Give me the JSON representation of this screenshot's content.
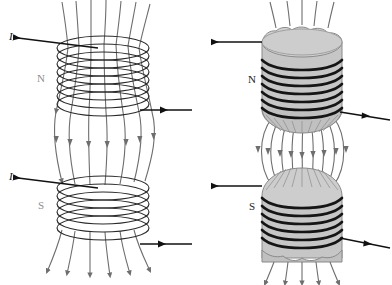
{
  "figure": {
    "background_color": "#ffffff",
    "panels": [
      {
        "id": "left-panel",
        "type": "air-core-solenoid-pair",
        "coils": [
          {
            "id": "left-top-coil",
            "pole_label": "N",
            "pole_label_color": "#8e8e8e",
            "turns": 8,
            "current_in_label": "I",
            "current_out_label": ""
          },
          {
            "id": "left-bottom-coil",
            "pole_label": "S",
            "pole_label_color": "#8e8e8e",
            "turns": 8,
            "current_in_label": "I",
            "current_out_label": ""
          }
        ],
        "field_lines": {
          "count": 7,
          "direction": "downward",
          "color": "#6e6e6e",
          "shape": "barrel-bulge-between-coils"
        }
      },
      {
        "id": "right-panel",
        "type": "iron-core-solenoid-pair",
        "core_color": "#c6c6c6",
        "core_edge_color": "#8a8a8a",
        "winding_color": "#1a1a1a",
        "coils": [
          {
            "id": "right-top-coil",
            "pole_label": "N",
            "pole_label_color": "#222222",
            "turns": 8,
            "current_in_label": "",
            "current_out_label": "",
            "core_top_edge": "scalloped",
            "core_bottom_edge": "domed"
          },
          {
            "id": "right-bottom-coil",
            "pole_label": "S",
            "pole_label_color": "#222222",
            "turns": 8,
            "current_in_label": "",
            "current_out_label": "",
            "core_top_edge": "domed",
            "core_bottom_edge": "scalloped"
          }
        ],
        "field_lines": {
          "count": 9,
          "direction": "downward",
          "color": "#6e6e6e",
          "shape": "barrel-bulge-between-cores"
        }
      }
    ],
    "labels": {
      "left_top_current": "I",
      "left_bottom_current": "I",
      "left_top_pole": "N",
      "left_bottom_pole": "S",
      "right_top_pole": "N",
      "right_bottom_pole": "S"
    },
    "colors": {
      "field_line": "#6e6e6e",
      "wire": "#2a2a2a",
      "core_fill": "#c6c6c6",
      "core_fill_light": "#d2d2d2",
      "core_stroke": "#8a8a8a",
      "winding": "#151515",
      "current_arrow": "#111111"
    }
  }
}
